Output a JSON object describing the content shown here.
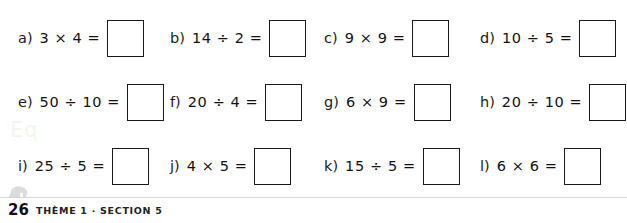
{
  "page": {
    "number": "26",
    "footer_text": "THÈME 1 · SECTION 5",
    "watermark": "Eq"
  },
  "exercises": [
    {
      "label": "a)",
      "expression": "3 × 4 =",
      "answer": ""
    },
    {
      "label": "b)",
      "expression": "14 ÷ 2 =",
      "answer": ""
    },
    {
      "label": "c)",
      "expression": "9 × 9 =",
      "answer": ""
    },
    {
      "label": "d)",
      "expression": "10 ÷ 5 =",
      "answer": ""
    },
    {
      "label": "e)",
      "expression": "50 ÷ 10 =",
      "answer": ""
    },
    {
      "label": "f)",
      "expression": "20 ÷ 4 =",
      "answer": ""
    },
    {
      "label": "g)",
      "expression": "6 × 9 =",
      "answer": ""
    },
    {
      "label": "h)",
      "expression": "20 ÷ 10 =",
      "answer": ""
    },
    {
      "label": "i)",
      "expression": "25 ÷ 5 =",
      "answer": ""
    },
    {
      "label": "j)",
      "expression": "4 × 5 =",
      "answer": ""
    },
    {
      "label": "k)",
      "expression": "15 ÷ 5 =",
      "answer": ""
    },
    {
      "label": "l)",
      "expression": "6 × 6 =",
      "answer": ""
    }
  ]
}
